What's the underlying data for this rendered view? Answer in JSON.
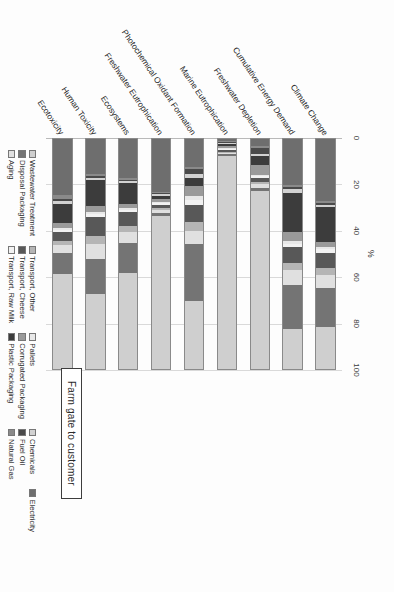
{
  "callout": {
    "label": "Farm gate to customer"
  },
  "chart_data": {
    "type": "bar",
    "orientation": "horizontal",
    "stacked": true,
    "normalized": true,
    "title": "",
    "xlabel": "%",
    "ylabel": "",
    "xlim": [
      0,
      100
    ],
    "xticks": [
      0,
      20,
      40,
      60,
      80,
      100
    ],
    "grid": true,
    "legend_position": "bottom",
    "categories": [
      "Climate Change",
      "Cumulative Energy Demand",
      "Freshwater Depletion",
      "Marine Eutrophication",
      "Photochemical Oxidant Formation",
      "Freshwater Eutrophication",
      "Ecosystems",
      "Human Toxicity",
      "Ecotoxicity"
    ],
    "series": [
      {
        "name": "Electricity",
        "color": "#6e6e6e",
        "values": [
          26.5,
          20.0,
          3.0,
          0.8,
          12.0,
          23.0,
          17.0,
          15.0,
          24.5
        ]
      },
      {
        "name": "Natural Gas",
        "color": "#8a8a8a",
        "values": [
          1.0,
          1.0,
          1.0,
          0.5,
          0.8,
          0.6,
          0.8,
          1.0,
          1.5
        ]
      },
      {
        "name": "Fuel Oil",
        "color": "#4a4a4a",
        "values": [
          0.8,
          0.8,
          2.5,
          0.5,
          2.5,
          0.5,
          0.6,
          0.8,
          1.0
        ]
      },
      {
        "name": "Chemicals",
        "color": "#d2d2d2",
        "values": [
          1.0,
          1.5,
          1.0,
          0.5,
          1.5,
          0.5,
          0.8,
          1.0,
          1.2
        ]
      },
      {
        "name": "Plastic Packaging",
        "color": "#3c3c3c",
        "values": [
          15.0,
          17.0,
          4.0,
          0.8,
          3.5,
          1.5,
          9.0,
          11.5,
          8.5
        ]
      },
      {
        "name": "Corrugated Packaging",
        "color": "#9a9a9a",
        "values": [
          2.0,
          4.0,
          4.0,
          0.8,
          4.5,
          1.2,
          2.0,
          2.5,
          2.0
        ]
      },
      {
        "name": "Pallets",
        "color": "#e8e8e8",
        "values": [
          1.2,
          1.2,
          0.8,
          0.5,
          1.5,
          0.5,
          0.8,
          1.0,
          0.8
        ]
      },
      {
        "name": "Transport, Raw Milk",
        "color": "#f2f2f2",
        "values": [
          1.5,
          1.5,
          0.8,
          0.5,
          2.5,
          0.8,
          0.8,
          1.0,
          0.8
        ]
      },
      {
        "name": "Transport, Cheese",
        "color": "#585858",
        "values": [
          6.5,
          7.0,
          1.5,
          0.8,
          7.0,
          1.5,
          6.0,
          8.5,
          4.0
        ]
      },
      {
        "name": "Transport, Other",
        "color": "#b5b5b5",
        "values": [
          3.0,
          3.0,
          1.2,
          0.5,
          4.0,
          0.8,
          2.5,
          3.5,
          2.0
        ]
      },
      {
        "name": "Aging",
        "color": "#e0e0e0",
        "values": [
          5.5,
          6.5,
          1.5,
          0.5,
          5.5,
          1.2,
          5.0,
          6.5,
          3.5
        ]
      },
      {
        "name": "Disposal Packaging",
        "color": "#747474",
        "values": [
          17.0,
          19.0,
          1.5,
          0.8,
          25.0,
          1.5,
          13.0,
          15.0,
          9.0
        ]
      },
      {
        "name": "Wastewater Treatment",
        "color": "#cfcfcf",
        "values": [
          18.0,
          17.5,
          77.2,
          92.5,
          29.2,
          66.4,
          41.7,
          32.7,
          41.2
        ]
      }
    ]
  }
}
